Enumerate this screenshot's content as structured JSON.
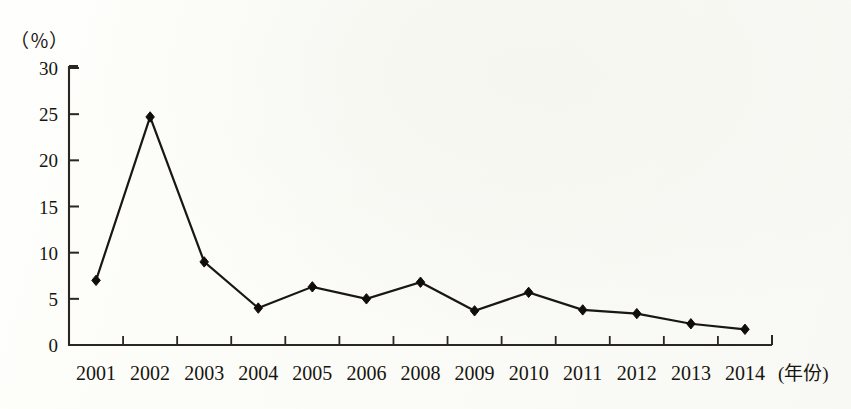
{
  "chart_data": {
    "type": "line",
    "title": "",
    "subtitle": "",
    "xlabel": "(年份)",
    "ylabel": "(％)",
    "categories": [
      "2001",
      "2002",
      "2003",
      "2004",
      "2005",
      "2006",
      "2008",
      "2009",
      "2010",
      "2011",
      "2012",
      "2013",
      "2014"
    ],
    "values": [
      7.0,
      24.7,
      9.0,
      4.0,
      6.3,
      5.0,
      6.8,
      3.7,
      5.7,
      3.8,
      3.4,
      2.3,
      1.7
    ],
    "series": [
      {
        "name": "",
        "values": [
          7.0,
          24.7,
          9.0,
          4.0,
          6.3,
          5.0,
          6.8,
          3.7,
          5.7,
          3.8,
          3.4,
          2.3,
          1.7
        ]
      }
    ],
    "ylim": [
      0,
      30
    ],
    "yticks": [
      0,
      5,
      10,
      15,
      20,
      25,
      30
    ],
    "ytick_labels": [
      "0",
      "5",
      "10",
      "15",
      "20",
      "25",
      "30"
    ],
    "grid": false,
    "legend": false,
    "legend_position": "none",
    "marker": "diamond",
    "line_color": "#1a1713",
    "marker_color": "#100d0a",
    "axis_color": "#2a2622",
    "background_color": "#fdfdfb"
  },
  "axis": {
    "unit_label": "（％）",
    "x_axis_caption": "(年份)"
  }
}
